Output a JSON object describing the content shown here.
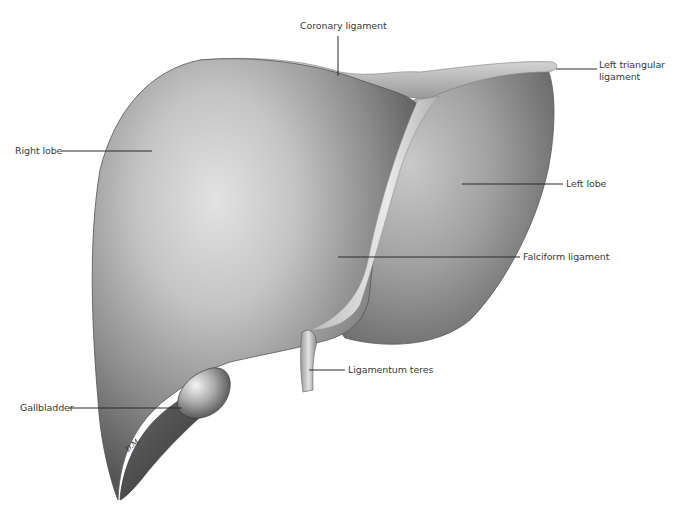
{
  "figure": {
    "background": "#ffffff",
    "tones": {
      "dark": "#4a4a4a",
      "mid": "#8a8a8a",
      "light": "#cfcfcf",
      "highlight": "#e6e6e6",
      "text": "#3a3a3a"
    },
    "signature": "D.M."
  },
  "labels": {
    "coronary_ligament": "Coronary ligament",
    "left_triangular_ligament_line1": "Left triangular",
    "left_triangular_ligament_line2": "ligament",
    "right_lobe": "Right lobe",
    "left_lobe": "Left lobe",
    "falciform_ligament": "Falciform ligament",
    "ligamentum_teres": "Ligamentum teres",
    "gallbladder": "Gallbladder"
  }
}
